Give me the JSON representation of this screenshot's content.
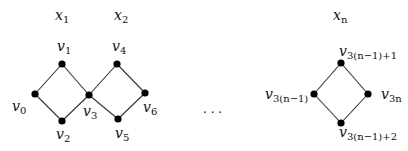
{
  "diagram": {
    "groups": [
      {
        "label": "x",
        "sub": "1"
      },
      {
        "label": "x",
        "sub": "2"
      },
      {
        "label": "x",
        "sub": "n"
      }
    ],
    "ellipsis": "· · ·",
    "vertices": [
      {
        "name": "v",
        "sub": "0"
      },
      {
        "name": "v",
        "sub": "1"
      },
      {
        "name": "v",
        "sub": "2"
      },
      {
        "name": "v",
        "sub": "3"
      },
      {
        "name": "v",
        "sub": "4"
      },
      {
        "name": "v",
        "sub": "5"
      },
      {
        "name": "v",
        "sub": "6"
      },
      {
        "name": "v",
        "sub": "3(n−1)"
      },
      {
        "name": "v",
        "sub": "3(n−1)+1"
      },
      {
        "name": "v",
        "sub": "3(n−1)+2"
      },
      {
        "name": "v",
        "sub": "3n"
      }
    ],
    "edges": [
      [
        "v0",
        "v1"
      ],
      [
        "v0",
        "v2"
      ],
      [
        "v1",
        "v3"
      ],
      [
        "v2",
        "v3"
      ],
      [
        "v3",
        "v4"
      ],
      [
        "v3",
        "v5"
      ],
      [
        "v4",
        "v6"
      ],
      [
        "v5",
        "v6"
      ],
      [
        "v3(n-1)",
        "v3(n-1)+1"
      ],
      [
        "v3(n-1)",
        "v3(n-1)+2"
      ],
      [
        "v3(n-1)+1",
        "v3n"
      ],
      [
        "v3(n-1)+2",
        "v3n"
      ]
    ]
  }
}
